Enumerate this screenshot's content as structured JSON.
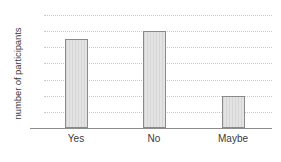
{
  "chart_data": {
    "type": "bar",
    "title": "",
    "subtitle": "",
    "xlabel": "",
    "ylabel": "number of participants",
    "categories": [
      "Yes",
      "No",
      "Maybe"
    ],
    "values": [
      11,
      12,
      4
    ],
    "series": [
      {
        "name": "number of participants",
        "values": [
          11,
          12,
          4
        ]
      }
    ],
    "ylim": [
      0,
      14
    ],
    "ytick_labels": [
      "0",
      "2",
      "4",
      "6",
      "8",
      "10",
      "12",
      "14"
    ],
    "ytick_values": [
      0,
      2,
      4,
      6,
      8,
      10,
      12,
      14
    ],
    "xtick_labels": [
      "Yes",
      "No",
      "Maybe"
    ],
    "grid": true,
    "grid_axis": "y",
    "grid_style": "dotted",
    "legend": false,
    "legend_position": "none",
    "annotations": [],
    "colors": {
      "background": "#ffffff",
      "bar_fill": "#dddddd",
      "bar_stripe": "#d6d6d6",
      "bar_border": "#8a8a8a",
      "gridline": "#c8c8c8",
      "axis_line": "#8d8d8d",
      "text": "#3a3a3a"
    }
  }
}
